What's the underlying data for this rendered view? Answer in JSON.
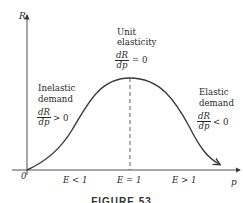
{
  "axes": {
    "y_label": "R",
    "x_label": "p",
    "origin_label": "0"
  },
  "regions": {
    "inelastic": {
      "title_line1": "Inelastic",
      "title_line2": "demand",
      "deriv_num": "dR",
      "deriv_den": "dp",
      "relation": "> 0"
    },
    "unit": {
      "title_line1": "Unit",
      "title_line2": "elasticity",
      "deriv_num": "dR",
      "deriv_den": "dp",
      "relation": "= 0"
    },
    "elastic": {
      "title_line1": "Elastic",
      "title_line2": "demand",
      "deriv_num": "dR",
      "deriv_den": "dp",
      "relation": "< 0"
    }
  },
  "x_ticks": {
    "left": "E < 1",
    "mid": "E = 1",
    "right": "E > 1"
  },
  "caption": "FIGURE 53",
  "colors": {
    "curve": "#3a3a3a",
    "axis": "#3a3a3a",
    "text": "#2a2a2a",
    "background": "#ffffff"
  }
}
